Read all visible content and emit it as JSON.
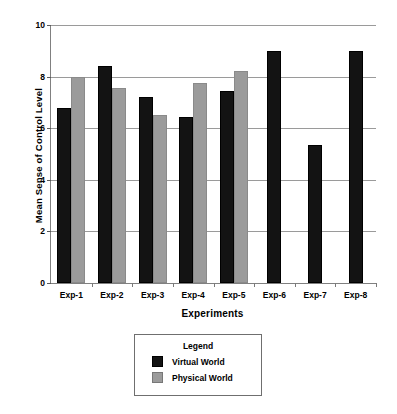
{
  "chart_data": {
    "type": "bar",
    "title": "",
    "xlabel": "Experiments",
    "ylabel": "Mean Sense of Control Level",
    "categories": [
      "Exp-1",
      "Exp-2",
      "Exp-3",
      "Exp-4",
      "Exp-5",
      "Exp-6",
      "Exp-7",
      "Exp-8"
    ],
    "series": [
      {
        "name": "Virtual World",
        "color": "#131313",
        "values": [
          6.8,
          8.4,
          7.2,
          6.45,
          7.45,
          9.0,
          5.35,
          9.0
        ]
      },
      {
        "name": "Physical World",
        "color": "#9b9b9b",
        "values": [
          8.0,
          7.55,
          6.5,
          7.75,
          8.2,
          null,
          null,
          null
        ]
      }
    ],
    "ylim": [
      0,
      10
    ],
    "yticks": [
      0,
      2,
      4,
      6,
      8,
      10
    ],
    "ytick_labels": [
      "0",
      "2",
      "4",
      "6",
      "8",
      "10"
    ],
    "grid": true,
    "legend_position": "below-axis"
  },
  "legend": {
    "title": "Legend",
    "entries": [
      {
        "label": "Virtual World",
        "swatch": "virtual"
      },
      {
        "label": "Physical World",
        "swatch": "physical"
      }
    ]
  }
}
